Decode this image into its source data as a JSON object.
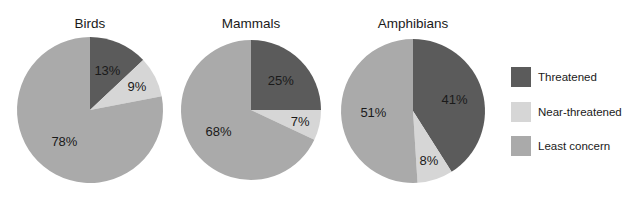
{
  "chart_data": {
    "type": "pie",
    "categories": [
      "Threatened",
      "Near-threatened",
      "Least concern"
    ],
    "colors": {
      "Threatened": "#5b5b5b",
      "Near-threatened": "#d6d6d6",
      "Least concern": "#aaaaaa"
    },
    "charts": [
      {
        "title": "Birds",
        "values": [
          13,
          9,
          78
        ],
        "labels": [
          "13%",
          "9%",
          "78%"
        ]
      },
      {
        "title": "Mammals",
        "values": [
          25,
          7,
          68
        ],
        "labels": [
          "25%",
          "7%",
          "68%"
        ]
      },
      {
        "title": "Amphibians",
        "values": [
          41,
          8,
          51
        ],
        "labels": [
          "41%",
          "8%",
          "51%"
        ]
      }
    ],
    "legend_position": "right",
    "start_angle": "12 o'clock, clockwise"
  },
  "legend": {
    "items": [
      {
        "label": "Threatened",
        "color": "#5b5b5b"
      },
      {
        "label": "Near-threatened",
        "color": "#d6d6d6"
      },
      {
        "label": "Least concern",
        "color": "#aaaaaa"
      }
    ]
  }
}
